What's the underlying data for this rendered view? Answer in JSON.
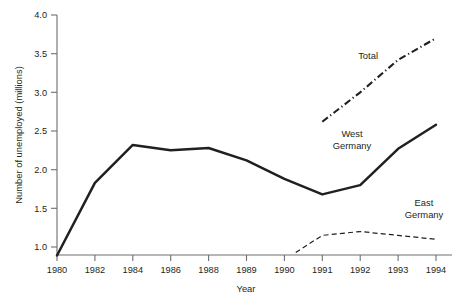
{
  "chart_data": {
    "type": "line",
    "title": "",
    "xlabel": "Year",
    "ylabel": "Number of unemployed (millions)",
    "categories": [
      "1980",
      "1982",
      "1984",
      "1986",
      "1988",
      "1989",
      "1990",
      "1991",
      "1992",
      "1993",
      "1994"
    ],
    "ylim": [
      0.78,
      4.0
    ],
    "yticks": [
      "1.0",
      "1.5",
      "2.0",
      "2.5",
      "3.0",
      "3.5",
      "4.0"
    ],
    "ytick_values": [
      1.0,
      1.5,
      2.0,
      2.5,
      3.0,
      3.5,
      4.0
    ],
    "grid": false,
    "legend_position": "inline-labels",
    "series": [
      {
        "name": "West Germany",
        "label": "West\nGermany",
        "label_line1": "West",
        "label_line2": "Germany",
        "style": "solid",
        "x": [
          "1980",
          "1982",
          "1984",
          "1986",
          "1988",
          "1989",
          "1990",
          "1991",
          "1992",
          "1993",
          "1994"
        ],
        "values": [
          0.89,
          1.83,
          2.32,
          2.25,
          2.28,
          2.12,
          1.88,
          1.68,
          1.8,
          2.27,
          2.58
        ]
      },
      {
        "name": "Total",
        "label": "Total",
        "label_line1": "Total",
        "label_line2": "",
        "style": "dash-dot",
        "x": [
          "1991",
          "1992",
          "1993",
          "1994"
        ],
        "values": [
          2.62,
          3.0,
          3.42,
          3.7
        ]
      },
      {
        "name": "East Germany",
        "label": "East\nGermany",
        "label_line1": "East",
        "label_line2": "Germany",
        "style": "dashed",
        "x": [
          "1990.3",
          "1991",
          "1992",
          "1993",
          "1994"
        ],
        "values": [
          0.93,
          1.15,
          1.2,
          1.15,
          1.1
        ]
      }
    ],
    "annotations": [
      {
        "text": "Total",
        "series": "Total"
      },
      {
        "text": "West Germany",
        "series": "West Germany"
      },
      {
        "text": "East Germany",
        "series": "East Germany"
      }
    ]
  }
}
